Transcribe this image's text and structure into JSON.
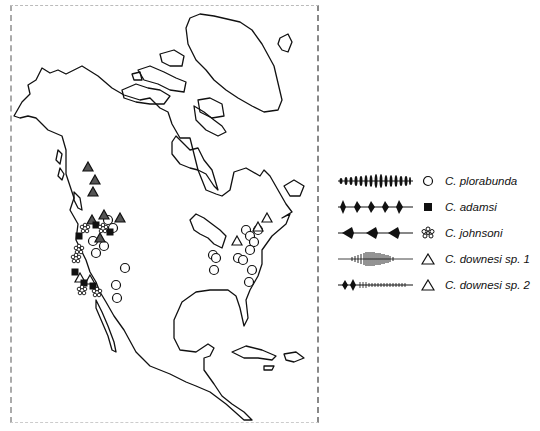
{
  "figure": {
    "type": "species distribution map",
    "region": "North America"
  },
  "legend": {
    "items": [
      {
        "label": "C. plorabunda",
        "symbol": "open-circle",
        "waveform": "regular-pulse-train"
      },
      {
        "label": "C. adamsi",
        "symbol": "filled-square",
        "waveform": "spaced-pulse-groups"
      },
      {
        "label": "C. johnsoni",
        "symbol": "asterisk-flower",
        "waveform": "sparse-triangular-pulses"
      },
      {
        "label": "C. downesi sp. 1",
        "symbol": "open-triangle",
        "waveform": "dense-buzz"
      },
      {
        "label": "C. downesi sp. 2",
        "symbol": "open-triangle",
        "waveform": "pulses-then-trill"
      }
    ]
  },
  "markers": {
    "west_triangles_filled": [
      [
        88,
        167
      ],
      [
        95,
        180
      ],
      [
        93,
        192
      ],
      [
        92,
        220
      ],
      [
        104,
        215
      ],
      [
        120,
        218
      ],
      [
        100,
        238
      ]
    ],
    "west_squares": [
      [
        96,
        225
      ],
      [
        110,
        232
      ],
      [
        79,
        236
      ],
      [
        75,
        272
      ],
      [
        84,
        283
      ],
      [
        93,
        286
      ]
    ],
    "west_asterisks": [
      [
        85,
        228
      ],
      [
        103,
        228
      ],
      [
        79,
        249
      ],
      [
        76,
        258
      ],
      [
        82,
        290
      ],
      [
        97,
        292
      ]
    ],
    "west_circles": [
      [
        108,
        220
      ],
      [
        113,
        228
      ],
      [
        93,
        241
      ],
      [
        96,
        253
      ],
      [
        104,
        246
      ],
      [
        125,
        268
      ],
      [
        116,
        285
      ],
      [
        117,
        298
      ]
    ],
    "west_open_triangles": [
      [
        80,
        278
      ],
      [
        90,
        280
      ]
    ],
    "east_circles": [
      [
        213,
        255
      ],
      [
        216,
        258
      ],
      [
        214,
        270
      ],
      [
        238,
        258
      ],
      [
        246,
        230
      ],
      [
        250,
        236
      ],
      [
        254,
        242
      ],
      [
        258,
        230
      ],
      [
        250,
        250
      ],
      [
        243,
        260
      ],
      [
        252,
        270
      ],
      [
        249,
        282
      ]
    ],
    "east_open_triangles": [
      [
        237,
        241
      ],
      [
        258,
        227
      ],
      [
        267,
        218
      ]
    ]
  }
}
